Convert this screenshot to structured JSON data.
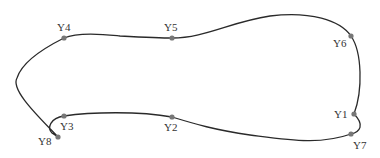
{
  "diagram": {
    "type": "closed-curve-with-points",
    "line_color": "#2a2a2a",
    "point_color": "#777777",
    "points": [
      {
        "id": "Y1",
        "label": "Y1",
        "x": 354,
        "y": 114,
        "lx": 334,
        "ly": 118
      },
      {
        "id": "Y2",
        "label": "Y2",
        "x": 172,
        "y": 117,
        "lx": 164,
        "ly": 131
      },
      {
        "id": "Y3",
        "label": "Y3",
        "x": 64,
        "y": 116,
        "lx": 60,
        "ly": 130
      },
      {
        "id": "Y4",
        "label": "Y4",
        "x": 64,
        "y": 38,
        "lx": 57,
        "ly": 31
      },
      {
        "id": "Y5",
        "label": "Y5",
        "x": 172,
        "y": 38,
        "lx": 164,
        "ly": 31
      },
      {
        "id": "Y6",
        "label": "Y6",
        "x": 351,
        "y": 36,
        "lx": 333,
        "ly": 47
      },
      {
        "id": "Y7",
        "label": "Y7",
        "x": 351,
        "y": 134,
        "lx": 353,
        "ly": 149
      },
      {
        "id": "Y8",
        "label": "Y8",
        "x": 58,
        "y": 137,
        "lx": 38,
        "ly": 145
      }
    ]
  }
}
